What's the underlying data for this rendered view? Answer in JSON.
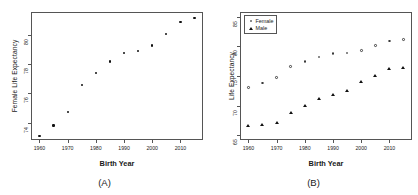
{
  "figure": {
    "background": "#ffffff",
    "panels": [
      {
        "caption": "(A)",
        "xlabel": "Birth Year",
        "ylabel": "Female Life Expectancy"
      },
      {
        "caption": "(B)",
        "xlabel": "Birth Year",
        "ylabel": "Life Expectancy"
      }
    ]
  },
  "legend": {
    "position": "top-left",
    "entries": [
      {
        "label": "Female",
        "marker": "open-circle",
        "color": "#3a3a3a"
      },
      {
        "label": "Male",
        "marker": "filled-triangle",
        "color": "#111111"
      }
    ]
  },
  "chart_data": [
    {
      "type": "scatter",
      "title": "(A)",
      "xlabel": "Birth Year",
      "ylabel": "Female Life Expectancy",
      "xlim": [
        1957,
        2018
      ],
      "ylim": [
        72.8,
        81.6
      ],
      "grid": false,
      "xticks": [
        1960,
        1970,
        1980,
        1990,
        2000,
        2010
      ],
      "yticks": [
        74,
        76,
        78,
        80
      ],
      "x": [
        1960,
        1965,
        1970,
        1975,
        1980,
        1985,
        1990,
        1995,
        2000,
        2005,
        2010,
        2015
      ],
      "values": [
        73.1,
        73.8,
        74.7,
        76.6,
        77.4,
        78.2,
        78.8,
        78.9,
        79.3,
        80.1,
        80.9,
        81.2
      ],
      "marker": "dot",
      "color": "#111111"
    },
    {
      "type": "scatter",
      "title": "(B)",
      "xlabel": "Birth Year",
      "ylabel": "Life Expectancy",
      "xlim": [
        1957,
        2018
      ],
      "ylim": [
        64.2,
        85.8
      ],
      "grid": false,
      "xticks": [
        1960,
        1970,
        1980,
        1990,
        2000,
        2010
      ],
      "yticks": [
        65,
        70,
        75,
        80,
        85
      ],
      "x": [
        1960,
        1965,
        1970,
        1975,
        1980,
        1985,
        1990,
        1995,
        2000,
        2005,
        2010,
        2015
      ],
      "series": [
        {
          "name": "Female",
          "marker": "open-circle",
          "color": "#3a3a3a",
          "values": [
            73.1,
            73.8,
            74.7,
            76.6,
            77.4,
            78.2,
            78.8,
            78.9,
            79.3,
            80.1,
            80.9,
            81.2
          ]
        },
        {
          "name": "Male",
          "marker": "filled-triangle",
          "color": "#111111",
          "values": [
            66.6,
            66.8,
            67.1,
            68.8,
            70.0,
            71.1,
            71.8,
            72.5,
            74.1,
            75.0,
            76.2,
            76.3
          ]
        }
      ]
    }
  ]
}
